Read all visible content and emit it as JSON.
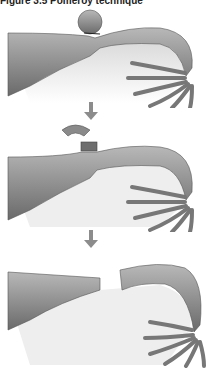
{
  "figure": {
    "title": "Figure 3.5 Pomeroy technique",
    "steps": [
      {
        "label": "Loop of fallopian tube tied with suture"
      },
      {
        "label": "Knuckle of tube excised above ligature"
      },
      {
        "label": "Cut ends separate after absorption"
      }
    ],
    "colors": {
      "tube_fill": "#9a9a9a",
      "tube_dark": "#5e5e5e",
      "mesosalpinx": "#e4e4e4",
      "arrow": "#8c8c8c",
      "background": "#ffffff"
    }
  }
}
